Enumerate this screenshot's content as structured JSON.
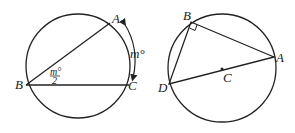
{
  "diagram_left": {
    "points": {
      "A": "A",
      "B": "B",
      "C": "C"
    },
    "arc_label": "m°",
    "angle_label_num": "m°",
    "angle_label_den": "2"
  },
  "diagram_right": {
    "points": {
      "A": "A",
      "B": "B",
      "C": "C",
      "D": "D"
    }
  }
}
